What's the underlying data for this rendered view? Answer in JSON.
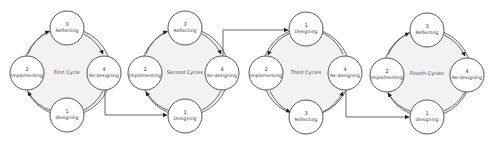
{
  "diagram": {
    "colors": {
      "ring_fill": "#f2f2f2",
      "ring_stroke": "#6a6a6a",
      "node_fill": "#ffffff",
      "node_stroke": "#555555",
      "text": "#333333",
      "arrow": "#222222"
    },
    "cycles": [
      {
        "title": "First Cycle",
        "nodes": {
          "top": {
            "num": "3",
            "label": "Reflecting"
          },
          "left": {
            "num": "2",
            "label": "Implementing"
          },
          "right": {
            "num": "4",
            "label": "Re-designing"
          },
          "bottom": {
            "num": "1",
            "label": "Designing"
          }
        }
      },
      {
        "title": "Second Cycles",
        "nodes": {
          "top": {
            "num": "3",
            "label": "Reflecting"
          },
          "left": {
            "num": "2",
            "label": "Implementing"
          },
          "right": {
            "num": "4",
            "label": "Re-designing"
          },
          "bottom": {
            "num": "1",
            "label": "Designing"
          }
        }
      },
      {
        "title": "Third Cycles",
        "nodes": {
          "top": {
            "num": "1",
            "label": "Designing"
          },
          "left": {
            "num": "2",
            "label": "Implementing"
          },
          "right": {
            "num": "4",
            "label": "Re-designing"
          },
          "bottom": {
            "num": "3",
            "label": "Reflecting"
          }
        }
      },
      {
        "title": "Fourth Cycles",
        "nodes": {
          "top": {
            "num": "3",
            "label": "Reflecting"
          },
          "left": {
            "num": "2",
            "label": "Implementing"
          },
          "right": {
            "num": "4",
            "label": "Re-designing"
          },
          "bottom": {
            "num": "1",
            "label": "Designing"
          }
        }
      }
    ]
  }
}
